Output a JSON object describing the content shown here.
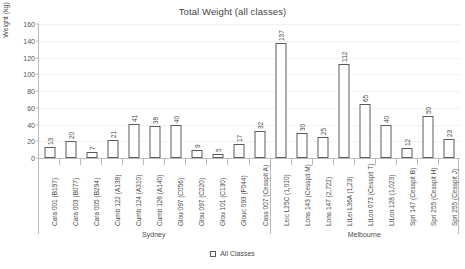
{
  "chart_data": {
    "type": "bar",
    "title": "Total Weight (all classes)",
    "xlabel": "",
    "ylabel": "Weight (kg)",
    "ylim": [
      0,
      160
    ],
    "ytick_step": 20,
    "yticks": [
      0,
      20,
      40,
      60,
      80,
      100,
      120,
      140,
      160
    ],
    "grid": true,
    "legend_position": "bottom",
    "legend": [
      "All Classes"
    ],
    "categories": [
      "Cara 001 (B197)",
      "Cara 003 (B077)",
      "Cara 005 (B294)",
      "Cumb 122 (A138)",
      "Cumb 124 (A310)",
      "Cumb 126 (A140)",
      "Glou 097 (C056)",
      "Glou 097 (C220)",
      "Glou 101 (C130)",
      "Glouc 093 (F044)",
      "Cass 007 (Cesspit A)",
      "Leic L25C (1,010)",
      "Lons 143 (Cesspit M)",
      "Lons 147 (2,722)",
      "LtLei L36A (1,23)",
      "LtLon 073 (Cesspit T)",
      "LtLon 128 (1,023)",
      "Spri 147 (Cesspit B)",
      "Spri 255 (Cesspit H)",
      "Spri 255 (Cesspit J)"
    ],
    "values": [
      13,
      20,
      7,
      21,
      41,
      38,
      40,
      9,
      5,
      17,
      32,
      137,
      30,
      25,
      112,
      65,
      40,
      12,
      50,
      23
    ],
    "series": [
      {
        "name": "All Classes",
        "values": [
          13,
          20,
          7,
          21,
          41,
          38,
          40,
          9,
          5,
          17,
          32,
          137,
          30,
          25,
          112,
          65,
          40,
          12,
          50,
          23
        ]
      }
    ],
    "groups": [
      {
        "label": "Sydney",
        "start_index": 0,
        "end_index": 10
      },
      {
        "label": "Melbourne",
        "start_index": 11,
        "end_index": 19
      }
    ],
    "colors": {
      "bar_fill": "#ffffff",
      "bar_stroke": "#5a5a5a",
      "axis": "#b9b9b9",
      "gridline": "#f2f2f2",
      "text": "#4a4a4a"
    }
  }
}
